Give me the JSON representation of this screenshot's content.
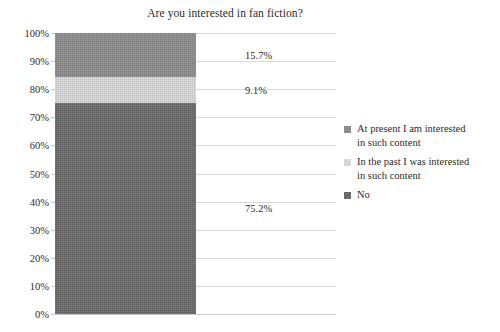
{
  "chart_data": {
    "type": "bar",
    "variant": "stacked-100-percent-single-bar",
    "title": "Are you interested in fan fiction?",
    "xlabel": "",
    "ylabel": "",
    "categories": [
      ""
    ],
    "series": [
      {
        "name": "At present I am interested in such content",
        "values": [
          15.7
        ],
        "label": "15.7%",
        "color": "#8c8c8c"
      },
      {
        "name": "In the past I was interested in such content",
        "values": [
          9.1
        ],
        "label": "9.1%",
        "color": "#d6d6d6"
      },
      {
        "name": "No",
        "values": [
          75.2
        ],
        "label": "75.2%",
        "color": "#6b6b6b"
      }
    ],
    "ylim": [
      0,
      100
    ],
    "yticks": [
      0,
      10,
      20,
      30,
      40,
      50,
      60,
      70,
      80,
      90,
      100
    ],
    "ytick_labels": [
      "0%",
      "10%",
      "20%",
      "30%",
      "40%",
      "50%",
      "60%",
      "70%",
      "80%",
      "90%",
      "100%"
    ],
    "grid": true,
    "grid_axis": "y",
    "legend_position": "right",
    "background_color": "#ffffff",
    "grid_color": "#d9d9d9",
    "text_color": "#2b2b2b"
  },
  "legend": {
    "items": [
      {
        "label_line1": "At present I am interested",
        "label_line2": "in such content",
        "color": "#8c8c8c"
      },
      {
        "label_line1": "In the past I was interested",
        "label_line2": "in such content",
        "color": "#d6d6d6"
      },
      {
        "label_line1": "No",
        "label_line2": "",
        "color": "#6b6b6b"
      }
    ]
  }
}
